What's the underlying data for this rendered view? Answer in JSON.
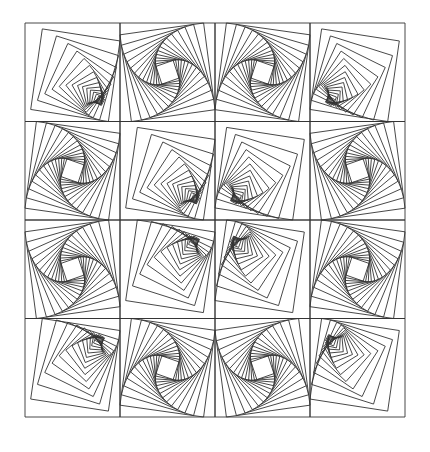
{
  "artwork": {
    "title": "Twisted squares line-art tile pattern",
    "grid": {
      "rows": 4,
      "cols": 4
    },
    "line_color": "#333333",
    "background": "#ffffff",
    "iterations": 14,
    "twist_fraction": 0.12,
    "tiles": [
      {
        "row": 0,
        "col": 0,
        "type": "fan",
        "corner": "br"
      },
      {
        "row": 0,
        "col": 1,
        "type": "spiral",
        "dir": "ccw",
        "focus": "center-low"
      },
      {
        "row": 0,
        "col": 2,
        "type": "spiral",
        "dir": "cw",
        "focus": "center-low"
      },
      {
        "row": 0,
        "col": 3,
        "type": "fan",
        "corner": "bl"
      },
      {
        "row": 1,
        "col": 0,
        "type": "spiral",
        "dir": "cw",
        "focus": "center-right"
      },
      {
        "row": 1,
        "col": 1,
        "type": "fan",
        "corner": "br"
      },
      {
        "row": 1,
        "col": 2,
        "type": "fan",
        "corner": "bl"
      },
      {
        "row": 1,
        "col": 3,
        "type": "spiral",
        "dir": "ccw",
        "focus": "center-left"
      },
      {
        "row": 2,
        "col": 0,
        "type": "spiral",
        "dir": "ccw",
        "focus": "center-right"
      },
      {
        "row": 2,
        "col": 1,
        "type": "fan",
        "corner": "tr"
      },
      {
        "row": 2,
        "col": 2,
        "type": "fan",
        "corner": "tl"
      },
      {
        "row": 2,
        "col": 3,
        "type": "spiral",
        "dir": "cw",
        "focus": "center-left"
      },
      {
        "row": 3,
        "col": 0,
        "type": "fan",
        "corner": "tr"
      },
      {
        "row": 3,
        "col": 1,
        "type": "spiral",
        "dir": "cw",
        "focus": "center-high"
      },
      {
        "row": 3,
        "col": 2,
        "type": "spiral",
        "dir": "ccw",
        "focus": "center-high"
      },
      {
        "row": 3,
        "col": 3,
        "type": "fan",
        "corner": "tl"
      }
    ]
  }
}
